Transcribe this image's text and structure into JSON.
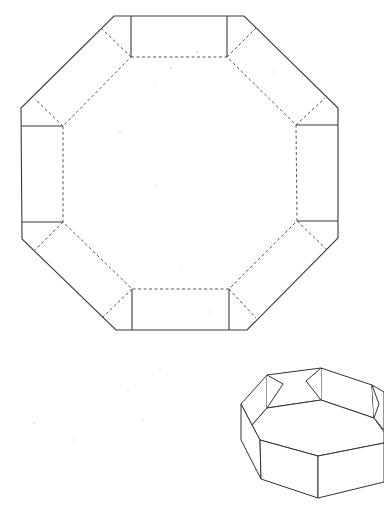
{
  "diagram": {
    "type": "papercraft-net",
    "net": {
      "description": "Flat net of an open-top octagonal box: octagonal base (dashed fold lines) with eight side flaps; four rectangular wall panels separated by diagonal corner flaps",
      "line_styles": {
        "cut": "solid",
        "fold": "dashed"
      },
      "outer_outline": [
        [
          114,
          16
        ],
        [
          244,
          16
        ],
        [
          338,
          108
        ],
        [
          338,
          238
        ],
        [
          247,
          330
        ],
        [
          116,
          330
        ],
        [
          22,
          239
        ],
        [
          21,
          108
        ]
      ],
      "inner_octagon_fold": [
        [
          131,
          57
        ],
        [
          227,
          57
        ],
        [
          296,
          125
        ],
        [
          297,
          221
        ],
        [
          229,
          289
        ],
        [
          132,
          289
        ],
        [
          63,
          222
        ],
        [
          63,
          126
        ]
      ],
      "wall_cut_lines": [
        [
          [
            131,
            16
          ],
          [
            131,
            57
          ]
        ],
        [
          [
            227,
            16
          ],
          [
            227,
            57
          ]
        ],
        [
          [
            296,
            125
          ],
          [
            338,
            125
          ]
        ],
        [
          [
            297,
            221
          ],
          [
            338,
            221
          ]
        ],
        [
          [
            229,
            289
          ],
          [
            229,
            330
          ]
        ],
        [
          [
            132,
            289
          ],
          [
            132,
            330
          ]
        ],
        [
          [
            63,
            222
          ],
          [
            22,
            222
          ]
        ],
        [
          [
            63,
            126
          ],
          [
            21,
            126
          ]
        ]
      ],
      "corner_fold_lines": [
        [
          [
            131,
            57
          ],
          [
            102,
            29
          ]
        ],
        [
          [
            227,
            57
          ],
          [
            256,
            28
          ]
        ],
        [
          [
            296,
            125
          ],
          [
            325,
            99
          ]
        ],
        [
          [
            297,
            221
          ],
          [
            326,
            248
          ]
        ],
        [
          [
            229,
            289
          ],
          [
            256,
            317
          ]
        ],
        [
          [
            132,
            289
          ],
          [
            103,
            317
          ]
        ],
        [
          [
            63,
            222
          ],
          [
            35,
            250
          ]
        ],
        [
          [
            63,
            126
          ],
          [
            35,
            100
          ]
        ]
      ]
    },
    "assembled_view": {
      "description": "Isometric sketch of the folded octagonal box with corner tabs visible on the rim",
      "position": "bottom-right"
    },
    "colors": {
      "line": "#3a3a3a",
      "background": "#ffffff"
    }
  }
}
